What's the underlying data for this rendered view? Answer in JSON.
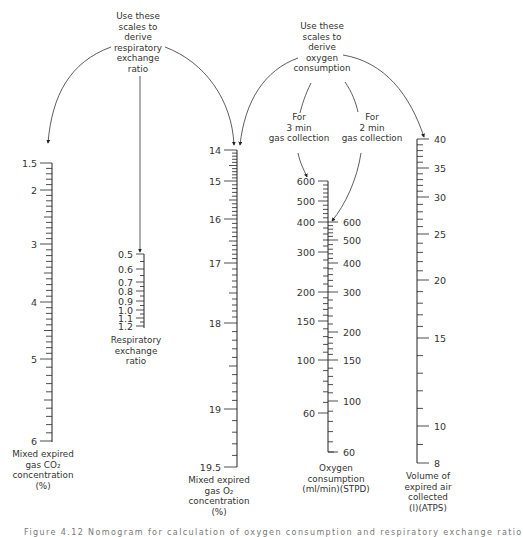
{
  "annotations": {
    "rer_note": [
      "Use these",
      "scales to",
      "derive",
      "respiratory",
      "exchange",
      "ratio"
    ],
    "o2_note": [
      "Use these",
      "scales to",
      "derive",
      "oxygen",
      "consumption"
    ],
    "three_min": [
      "For",
      "3 min",
      "gas collection"
    ],
    "two_min": [
      "For",
      "2 min",
      "gas collection"
    ]
  },
  "scales": {
    "co2": {
      "title": [
        "Mixed expired",
        "gas CO₂",
        "concentration",
        "(%)"
      ],
      "labels": [
        "1.5",
        "2",
        "3",
        "4",
        "5",
        "6"
      ]
    },
    "rer": {
      "title": [
        "Respiratory",
        "exchange",
        "ratio"
      ],
      "labels": [
        "0.5",
        "0.6",
        "0.7",
        "0.8",
        "0.9",
        "1.0",
        "1.1",
        "1.2"
      ]
    },
    "o2": {
      "title": [
        "Mixed expired",
        "gas O₂",
        "concentration",
        "(%)"
      ],
      "labels": [
        "14",
        "15",
        "16",
        "17",
        "18",
        "19",
        "19.5"
      ]
    },
    "vo2": {
      "title": [
        "Oxygen",
        "consumption",
        "(ml/min)(STPD)"
      ],
      "left_labels_3min": [
        "600",
        "500",
        "400",
        "300",
        "200",
        "150",
        "100",
        "60"
      ],
      "right_labels_2min": [
        "600",
        "500",
        "400",
        "300",
        "200",
        "150",
        "100",
        "60"
      ]
    },
    "ve": {
      "title": [
        "Volume of",
        "expired air",
        "collected",
        "(l)(ATPS)"
      ],
      "labels": [
        "40",
        "35",
        "30",
        "25",
        "20",
        "15",
        "10",
        "8"
      ]
    }
  },
  "caption": "Figure 4.12  Nomogram for calculation of oxygen consumption and respiratory exchange ratio",
  "chart_data": {
    "type": "nomogram",
    "title": "",
    "scales": [
      {
        "name": "Mixed expired gas CO2 concentration (%)",
        "min": 1.5,
        "max": 6,
        "ticks": [
          1.5,
          2,
          3,
          4,
          5,
          6
        ]
      },
      {
        "name": "Respiratory exchange ratio",
        "min": 0.5,
        "max": 1.2,
        "ticks": [
          0.5,
          0.6,
          0.7,
          0.8,
          0.9,
          1.0,
          1.1,
          1.2
        ]
      },
      {
        "name": "Mixed expired gas O2 concentration (%)",
        "min": 14,
        "max": 19.5,
        "ticks": [
          14,
          15,
          16,
          17,
          18,
          19,
          19.5
        ]
      },
      {
        "name": "Oxygen consumption (ml/min)(STPD) - 3 min gas collection",
        "min": 60,
        "max": 600,
        "ticks": [
          600,
          500,
          400,
          300,
          200,
          150,
          100,
          60
        ]
      },
      {
        "name": "Oxygen consumption (ml/min)(STPD) - 2 min gas collection",
        "min": 60,
        "max": 600,
        "ticks": [
          600,
          500,
          400,
          300,
          200,
          150,
          100,
          60
        ]
      },
      {
        "name": "Volume of expired air collected (l)(ATPS)",
        "min": 8,
        "max": 40,
        "ticks": [
          40,
          35,
          30,
          25,
          20,
          15,
          10,
          8
        ]
      }
    ]
  }
}
